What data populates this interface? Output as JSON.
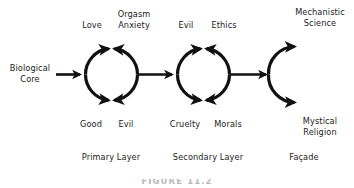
{
  "figure": {
    "caption": "FIGURE 11.2",
    "ink_color": "#111111",
    "text_color": "#1b1b1b"
  },
  "input": {
    "label": "Biological\nCore"
  },
  "layers": [
    {
      "name": "primary",
      "layer_label": "Primary Layer",
      "top_left_label": "Love",
      "top_right_label": "Orgasm\nAnxiety",
      "bottom_left_label": "Good",
      "bottom_right_label": "Evil"
    },
    {
      "name": "secondary",
      "layer_label": "Secondary Layer",
      "top_left_label": "Evil",
      "top_right_label": "Ethics",
      "bottom_left_label": "Cruelty",
      "bottom_right_label": "Morals",
      "layer_label_offset": "Secondary Layer"
    }
  ],
  "facade": {
    "layer_label": "Façade",
    "top_label": "Mechanistic\nScience",
    "bottom_label": "Mystical\nReligion"
  }
}
